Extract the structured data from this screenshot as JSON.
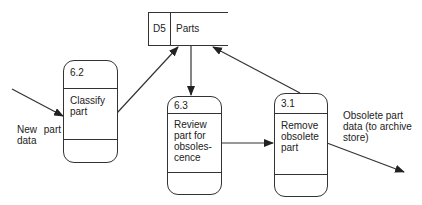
{
  "diagram": {
    "type": "data-flow-diagram",
    "data_store": {
      "id": "D5",
      "name": "Parts"
    },
    "processes": [
      {
        "id": "6.2",
        "label": "Classify\npart"
      },
      {
        "id": "6.3",
        "label": "Review\npart for\nobsoles-\ncence"
      },
      {
        "id": "3.1",
        "label": "Remove\nobsolete\npart"
      }
    ],
    "flows": [
      {
        "from": "external",
        "to": "6.2",
        "label": "New part\ndata"
      },
      {
        "from": "6.2",
        "to": "D5",
        "label": ""
      },
      {
        "from": "D5",
        "to": "6.3",
        "label": ""
      },
      {
        "from": "6.3",
        "to": "3.1",
        "label": ""
      },
      {
        "from": "3.1",
        "to": "D5",
        "label": ""
      },
      {
        "from": "3.1",
        "to": "external",
        "label": "Obsolete part\ndata (to archive\nstore)"
      }
    ]
  }
}
